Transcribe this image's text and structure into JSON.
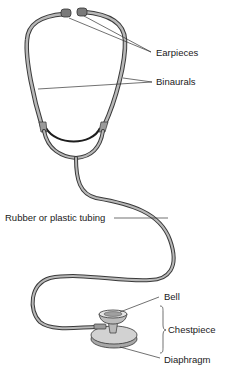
{
  "figure": {
    "labels": {
      "earpieces": "Earpieces",
      "binaurals": "Binaurals",
      "tubing": "Rubber or plastic tubing",
      "bell": "Bell",
      "chestpiece": "Chestpiece",
      "diaphragm": "Diaphragm"
    },
    "colors": {
      "outline": "#3a3a3a",
      "tube_fill": "#b8b8b8",
      "earpiece_fill": "#7a7a7a",
      "chestpiece_fill": "#c8c8c8",
      "text": "#1a1a1a"
    }
  }
}
